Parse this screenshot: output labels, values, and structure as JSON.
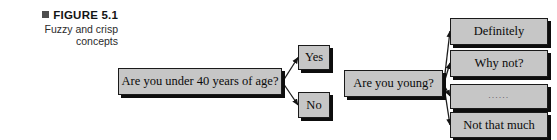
{
  "figure": {
    "bullet_icon": "square-bullet-icon",
    "title": "FIGURE 5.1",
    "subtitle": "Fuzzy and crisp\nconcepts"
  },
  "colors": {
    "box_fill": "#c6c6c6",
    "box_border": "#1a1a1a",
    "box_shadow": "#0d0d0d",
    "connector": "#1c1c1c",
    "bullet": "#4d4d4d",
    "page_background": "#ffffff"
  },
  "diagrams": [
    {
      "id": "crisp-concept",
      "question": "Are you under 40 years of age?",
      "answers": [
        {
          "label": "Yes"
        },
        {
          "label": "No"
        }
      ]
    },
    {
      "id": "fuzzy-concept",
      "question": "Are you young?",
      "answers": [
        {
          "label": "Definitely"
        },
        {
          "label": "Why not?"
        },
        {
          "label": "......"
        },
        {
          "label": "Not that much"
        }
      ]
    }
  ]
}
